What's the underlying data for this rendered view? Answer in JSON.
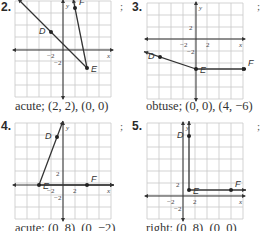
{
  "problems": [
    {
      "number": "2.",
      "separator": ";",
      "caption": "acute; (2, 2), (0, 0)",
      "points": {
        "D": [
          -2,
          3
        ],
        "E": [
          4,
          -3
        ],
        "F": [
          2,
          7
        ]
      },
      "labels": {
        "D": "D",
        "E": "E",
        "F": "F",
        "x": "x",
        "y": "y"
      },
      "ticks": {
        "x": "−2",
        "y": "−2"
      }
    },
    {
      "number": "3.",
      "separator": ";",
      "caption": "obtuse; (0, 0), (4, −6)",
      "points": {
        "D": [
          -6,
          -3
        ],
        "E": [
          0,
          -5
        ],
        "F": [
          8,
          -5
        ]
      },
      "labels": {
        "D": "D",
        "E": "E",
        "F": "F",
        "x": "x",
        "y": "y"
      },
      "ticks": {
        "x_neg": "−2",
        "x_pos": "2",
        "y_pos": "2",
        "y_neg": "−2"
      }
    },
    {
      "number": "4.",
      "separator": ";",
      "caption": "acute; (0, 8), (0, −2)",
      "points": {
        "D": [
          -1,
          8
        ],
        "E": [
          -4,
          0
        ],
        "F": [
          4,
          0
        ]
      },
      "labels": {
        "D": "D",
        "E": "E",
        "F": "F",
        "x": "x",
        "y": "y"
      },
      "ticks": {
        "x_neg": "−2",
        "x_pos": "2",
        "y_pos": "2",
        "y_neg": "−2"
      }
    },
    {
      "number": "5.",
      "separator": ";",
      "caption": "right; (0, 8), (0, 0)",
      "points": {
        "D": [
          1,
          10
        ],
        "E": [
          1,
          1
        ],
        "F": [
          8,
          1
        ]
      },
      "labels": {
        "D": "D",
        "E": "E",
        "F": "F",
        "x": "x",
        "y": "y"
      },
      "ticks": {
        "x_neg": "−2",
        "x_pos": "2",
        "y_pos": "2",
        "y_neg": "−2"
      }
    }
  ]
}
